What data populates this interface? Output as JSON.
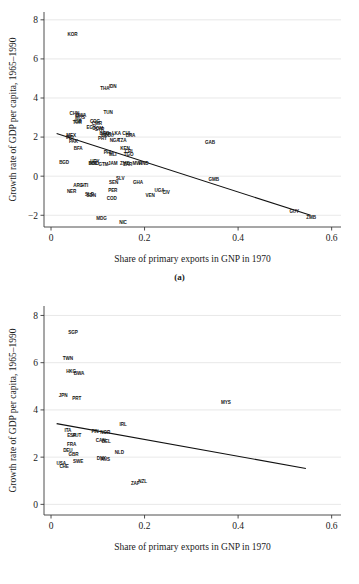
{
  "figure": {
    "panels": [
      {
        "caption": "(a)",
        "chart_data": {
          "type": "scatter",
          "title": "",
          "xlabel": "Share of primary exports in GNP in 1970",
          "ylabel": "Growth rate of GDP per capita, 1965–1990",
          "xlim": [
            -0.015,
            0.62
          ],
          "ylim": [
            -2.6,
            8.4
          ],
          "xticks": [
            0,
            0.2,
            0.4,
            0.6
          ],
          "xticklabels": [
            "0",
            "0.2",
            "0.4",
            "0.6"
          ],
          "yticks": [
            -2,
            0,
            2,
            4,
            6,
            8
          ],
          "yticklabels": [
            "−2",
            "0",
            "2",
            "4",
            "6",
            "8"
          ],
          "grid": true,
          "grid_axis": "y",
          "legend": "none",
          "marker": "text-label",
          "fitline": {
            "type": "linear",
            "x": [
              0.012,
              0.555
            ],
            "y": [
              2.18,
              -2.0
            ]
          },
          "points": [
            {
              "label": "KOR",
              "x": 0.046,
              "y": 7.25
            },
            {
              "label": "THA",
              "x": 0.115,
              "y": 4.5
            },
            {
              "label": "IDN",
              "x": 0.132,
              "y": 4.62
            },
            {
              "label": "TUN",
              "x": 0.122,
              "y": 3.28
            },
            {
              "label": "CHN",
              "x": 0.05,
              "y": 3.2
            },
            {
              "label": "BWA",
              "x": 0.064,
              "y": 3.1
            },
            {
              "label": "MUS",
              "x": 0.062,
              "y": 3.0
            },
            {
              "label": "ISR",
              "x": 0.058,
              "y": 2.82
            },
            {
              "label": "TUR",
              "x": 0.056,
              "y": 2.76
            },
            {
              "label": "COG",
              "x": 0.094,
              "y": 2.8
            },
            {
              "label": "CMR",
              "x": 0.098,
              "y": 2.7
            },
            {
              "label": "EGY",
              "x": 0.086,
              "y": 2.52
            },
            {
              "label": "DOM",
              "x": 0.1,
              "y": 2.46
            },
            {
              "label": "SYR",
              "x": 0.104,
              "y": 2.4
            },
            {
              "label": "MEX",
              "x": 0.043,
              "y": 2.12
            },
            {
              "label": "IND",
              "x": 0.04,
              "y": 2.02
            },
            {
              "label": "BRB",
              "x": 0.114,
              "y": 2.2
            },
            {
              "label": "MAR",
              "x": 0.118,
              "y": 2.14
            },
            {
              "label": "ECU",
              "x": 0.124,
              "y": 2.1
            },
            {
              "label": "LKA",
              "x": 0.14,
              "y": 2.18
            },
            {
              "label": "CHL",
              "x": 0.162,
              "y": 2.2
            },
            {
              "label": "BRA",
              "x": 0.17,
              "y": 2.1
            },
            {
              "label": "PRY",
              "x": 0.11,
              "y": 1.94
            },
            {
              "label": "NGA",
              "x": 0.136,
              "y": 1.86
            },
            {
              "label": "TZA",
              "x": 0.152,
              "y": 1.86
            },
            {
              "label": "PAK",
              "x": 0.048,
              "y": 1.78
            },
            {
              "label": "GAB",
              "x": 0.34,
              "y": 1.76
            },
            {
              "label": "BFA",
              "x": 0.058,
              "y": 1.44
            },
            {
              "label": "KEN",
              "x": 0.158,
              "y": 1.45
            },
            {
              "label": "CRI",
              "x": 0.166,
              "y": 1.3
            },
            {
              "label": "PHL",
              "x": 0.122,
              "y": 1.25
            },
            {
              "label": "MLI",
              "x": 0.132,
              "y": 1.12
            },
            {
              "label": "TGO",
              "x": 0.166,
              "y": 1.1
            },
            {
              "label": "BGD",
              "x": 0.028,
              "y": 0.72
            },
            {
              "label": "URY",
              "x": 0.094,
              "y": 0.78
            },
            {
              "label": "BOL",
              "x": 0.09,
              "y": 0.68
            },
            {
              "label": "HND",
              "x": 0.092,
              "y": 0.64
            },
            {
              "label": "GTM",
              "x": 0.112,
              "y": 0.62
            },
            {
              "label": "JAM",
              "x": 0.132,
              "y": 0.66
            },
            {
              "label": "ZMB",
              "x": 0.158,
              "y": 0.64
            },
            {
              "label": "ZAR",
              "x": 0.164,
              "y": 0.6
            },
            {
              "label": "MWI",
              "x": 0.184,
              "y": 0.66
            },
            {
              "label": "HND2",
              "x": 0.198,
              "y": 0.66
            },
            {
              "label": "SLV",
              "x": 0.148,
              "y": -0.12
            },
            {
              "label": "SEN",
              "x": 0.134,
              "y": -0.3
            },
            {
              "label": "GHA",
              "x": 0.186,
              "y": -0.3
            },
            {
              "label": "GMB",
              "x": 0.348,
              "y": -0.16
            },
            {
              "label": "ARG",
              "x": 0.058,
              "y": -0.46
            },
            {
              "label": "HTI",
              "x": 0.072,
              "y": -0.46
            },
            {
              "label": "PER",
              "x": 0.132,
              "y": -0.74
            },
            {
              "label": "UGA",
              "x": 0.232,
              "y": -0.72
            },
            {
              "label": "CIV",
              "x": 0.246,
              "y": -0.82
            },
            {
              "label": "NER",
              "x": 0.044,
              "y": -0.78
            },
            {
              "label": "SLE",
              "x": 0.082,
              "y": -0.92
            },
            {
              "label": "SDN",
              "x": 0.086,
              "y": -0.98
            },
            {
              "label": "VEN",
              "x": 0.212,
              "y": -0.98
            },
            {
              "label": "COD",
              "x": 0.13,
              "y": -1.12
            },
            {
              "label": "GUY",
              "x": 0.52,
              "y": -1.78
            },
            {
              "label": "ZMB2",
              "x": 0.556,
              "y": -2.1
            },
            {
              "label": "MDG",
              "x": 0.108,
              "y": -2.16
            },
            {
              "label": "NIC",
              "x": 0.154,
              "y": -2.34
            }
          ]
        }
      },
      {
        "caption": "(b)",
        "chart_data": {
          "type": "scatter",
          "title": "",
          "xlabel": "Share of primary exports in GNP in 1970",
          "ylabel": "Growth rate of GDP per capita, 1965–1990",
          "xlim": [
            -0.015,
            0.62
          ],
          "ylim": [
            -0.45,
            8.4
          ],
          "xticks": [
            0,
            0.2,
            0.4,
            0.6
          ],
          "xticklabels": [
            "0",
            "0.2",
            "0.4",
            "0.6"
          ],
          "yticks": [
            0,
            2,
            4,
            6,
            8
          ],
          "yticklabels": [
            "0",
            "2",
            "4",
            "6",
            "8"
          ],
          "grid": true,
          "grid_axis": "y",
          "legend": "none",
          "marker": "text-label",
          "fitline": {
            "type": "linear",
            "x": [
              0.012,
              0.545
            ],
            "y": [
              3.42,
              1.52
            ]
          },
          "points": [
            {
              "label": "SGP",
              "x": 0.047,
              "y": 7.28
            },
            {
              "label": "TWN",
              "x": 0.036,
              "y": 6.18
            },
            {
              "label": "HKG",
              "x": 0.043,
              "y": 5.62
            },
            {
              "label": "BWA",
              "x": 0.06,
              "y": 5.56
            },
            {
              "label": "JPN",
              "x": 0.026,
              "y": 4.62
            },
            {
              "label": "PRT",
              "x": 0.055,
              "y": 4.5
            },
            {
              "label": "MYS",
              "x": 0.374,
              "y": 4.32
            },
            {
              "label": "IRL",
              "x": 0.154,
              "y": 3.38
            },
            {
              "label": "ITA",
              "x": 0.036,
              "y": 3.12
            },
            {
              "label": "FIN",
              "x": 0.094,
              "y": 3.1
            },
            {
              "label": "NOR",
              "x": 0.116,
              "y": 3.06
            },
            {
              "label": "ESP",
              "x": 0.044,
              "y": 2.94
            },
            {
              "label": "AUT",
              "x": 0.055,
              "y": 2.92
            },
            {
              "label": "CAN",
              "x": 0.106,
              "y": 2.7
            },
            {
              "label": "BEL",
              "x": 0.118,
              "y": 2.68
            },
            {
              "label": "FRA",
              "x": 0.044,
              "y": 2.54
            },
            {
              "label": "DEU",
              "x": 0.036,
              "y": 2.3
            },
            {
              "label": "NLD",
              "x": 0.146,
              "y": 2.2
            },
            {
              "label": "GBR",
              "x": 0.048,
              "y": 2.12
            },
            {
              "label": "DNK",
              "x": 0.108,
              "y": 1.94
            },
            {
              "label": "AUS",
              "x": 0.116,
              "y": 1.92
            },
            {
              "label": "SWE",
              "x": 0.058,
              "y": 1.82
            },
            {
              "label": "USA",
              "x": 0.022,
              "y": 1.76
            },
            {
              "label": "CHE",
              "x": 0.028,
              "y": 1.62
            },
            {
              "label": "ZAF",
              "x": 0.18,
              "y": 0.88
            },
            {
              "label": "NZL",
              "x": 0.196,
              "y": 0.98
            }
          ]
        }
      }
    ]
  }
}
